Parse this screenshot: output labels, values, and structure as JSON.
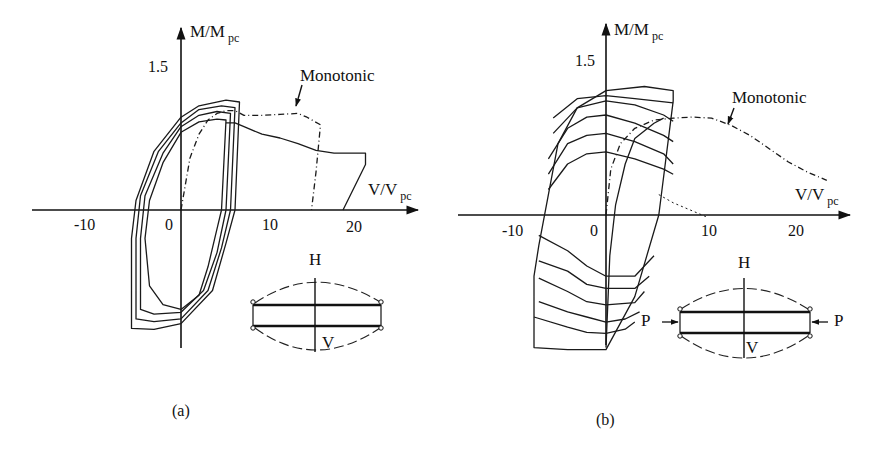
{
  "figure": {
    "captions": [
      "(a)",
      "(b)"
    ]
  },
  "chart_data": [
    {
      "type": "line",
      "panel": "(a)",
      "title": "",
      "xlabel": "V/V",
      "xlabel_sub": "pc",
      "ylabel": "M/M",
      "ylabel_sub": "pc",
      "x_ticks": [
        "-10",
        "0",
        "10",
        "20"
      ],
      "y_ticks": [
        "1.5"
      ],
      "xlim": [
        -16,
        26
      ],
      "ylim": [
        -1.5,
        1.7
      ],
      "grid": false,
      "annotation": "Monotonic",
      "inset": {
        "top_label": "H",
        "bottom_label": "V",
        "axial_load": false
      },
      "series": [
        {
          "name": "Monotonic",
          "style": "dashdot",
          "x": [
            0,
            1,
            2,
            3,
            4,
            5,
            6,
            7,
            9,
            11,
            13,
            14,
            15.5,
            15,
            14.5
          ],
          "y": [
            0,
            0.55,
            0.8,
            0.95,
            1.02,
            1.05,
            1.05,
            1.0,
            1.0,
            1.01,
            1.02,
            0.98,
            0.9,
            0.4,
            0
          ]
        },
        {
          "name": "Cyclic envelope tail",
          "style": "solid",
          "x": [
            5,
            6,
            7,
            9,
            11,
            13,
            15,
            17,
            20.5,
            20.5,
            18
          ],
          "y": [
            0.92,
            0.92,
            0.88,
            0.8,
            0.76,
            0.7,
            0.63,
            0.6,
            0.6,
            0.48,
            0
          ]
        },
        {
          "name": "Cycle 1",
          "style": "solid",
          "x": [
            4.5,
            5,
            4,
            2,
            0,
            -2,
            -3.5,
            -4,
            -3.5,
            -2,
            0,
            2,
            3,
            4,
            4.5
          ],
          "y": [
            0,
            0.95,
            0.96,
            0.93,
            0.82,
            0.5,
            0.1,
            -0.3,
            -0.8,
            -1.0,
            -1.05,
            -0.9,
            -0.6,
            -0.2,
            0
          ]
        },
        {
          "name": "Cycle 2",
          "style": "solid",
          "x": [
            5,
            5.5,
            4,
            2,
            0,
            -2,
            -4,
            -4.5,
            -4.5,
            -3,
            0,
            2.5,
            4,
            5
          ],
          "y": [
            0,
            1.02,
            1.04,
            1.0,
            0.88,
            0.6,
            0.15,
            -0.3,
            -1.05,
            -1.1,
            -1.08,
            -0.85,
            -0.45,
            0
          ]
        },
        {
          "name": "Cycle 3",
          "style": "solid",
          "x": [
            5.5,
            6,
            4.5,
            2,
            0,
            -2.5,
            -4.5,
            -5,
            -5,
            -3,
            0,
            3,
            4.5,
            5.5
          ],
          "y": [
            0,
            1.08,
            1.1,
            1.06,
            0.92,
            0.62,
            0.15,
            -0.3,
            -1.15,
            -1.18,
            -1.15,
            -0.85,
            -0.4,
            0
          ]
        },
        {
          "name": "Cycle 4",
          "style": "solid",
          "x": [
            6,
            6.5,
            5,
            2,
            0,
            -3,
            -5,
            -5.5,
            -5.5,
            -3,
            0,
            3.5,
            5,
            6
          ],
          "y": [
            0,
            1.14,
            1.16,
            1.1,
            0.98,
            0.62,
            0.1,
            -0.3,
            -1.25,
            -1.26,
            -1.2,
            -0.85,
            -0.35,
            0
          ]
        }
      ]
    },
    {
      "type": "line",
      "panel": "(b)",
      "title": "",
      "xlabel": "V/V",
      "xlabel_sub": "pc",
      "ylabel": "M/M",
      "ylabel_sub": "pc",
      "x_ticks": [
        "-10",
        "0",
        "10",
        "20"
      ],
      "y_ticks": [
        "1.5"
      ],
      "xlim": [
        -16,
        25
      ],
      "ylim": [
        -1.5,
        1.6
      ],
      "grid": false,
      "annotation": "Monotonic",
      "inset": {
        "top_label": "H",
        "bottom_label": "V",
        "axial_load": true,
        "load_label": "P"
      },
      "series": [
        {
          "name": "Monotonic",
          "style": "dashdot",
          "x": [
            0,
            0.5,
            1.5,
            3,
            5,
            7,
            9,
            11,
            13,
            15,
            17,
            19,
            21,
            23
          ],
          "y": [
            0,
            0.45,
            0.7,
            0.85,
            0.93,
            0.95,
            0.96,
            0.95,
            0.88,
            0.78,
            0.65,
            0.52,
            0.42,
            0.34
          ]
        },
        {
          "name": "Outer loop",
          "style": "solid",
          "x": [
            5.5,
            7,
            7,
            4,
            0,
            -3,
            -5,
            -6,
            -7,
            -7.5,
            -7.5,
            -4,
            0,
            3,
            5.5
          ],
          "y": [
            0,
            1.12,
            1.22,
            1.26,
            1.22,
            1.05,
            0.7,
            0.2,
            -0.3,
            -0.6,
            -1.3,
            -1.32,
            -1.32,
            -0.8,
            0
          ]
        },
        {
          "name": "Cycle a",
          "style": "solid",
          "x": [
            -6,
            -4,
            -2,
            0,
            3,
            6,
            7
          ],
          "y": [
            0.25,
            0.5,
            0.6,
            0.62,
            0.55,
            0.45,
            0.4
          ]
        },
        {
          "name": "Cycle b",
          "style": "solid",
          "x": [
            -6,
            -4,
            -2,
            0,
            3,
            6,
            7
          ],
          "y": [
            0.4,
            0.7,
            0.78,
            0.8,
            0.72,
            0.6,
            0.5
          ]
        },
        {
          "name": "Cycle c",
          "style": "solid",
          "x": [
            -6,
            -4,
            -2,
            0,
            3,
            6,
            7
          ],
          "y": [
            0.55,
            0.85,
            0.96,
            0.98,
            0.9,
            0.78,
            0.72
          ]
        },
        {
          "name": "Cycle d",
          "style": "solid",
          "x": [
            -5.5,
            -3,
            0,
            3,
            6,
            7
          ],
          "y": [
            0.8,
            1.05,
            1.12,
            1.08,
            0.98,
            0.92
          ]
        },
        {
          "name": "Cycle e",
          "style": "solid",
          "x": [
            -5.5,
            -3,
            0,
            3,
            7
          ],
          "y": [
            0.95,
            1.14,
            1.17,
            1.14,
            1.1
          ]
        },
        {
          "name": "Cycle f",
          "style": "solid",
          "x": [
            -7,
            -4,
            -2,
            0,
            3,
            5
          ],
          "y": [
            -0.2,
            -0.35,
            -0.5,
            -0.6,
            -0.6,
            -0.4
          ]
        },
        {
          "name": "Cycle g",
          "style": "solid",
          "x": [
            -7,
            -4,
            -2,
            0,
            3,
            4.5
          ],
          "y": [
            -0.45,
            -0.55,
            -0.68,
            -0.72,
            -0.72,
            -0.6
          ]
        },
        {
          "name": "Cycle h",
          "style": "solid",
          "x": [
            -7,
            -4,
            -2,
            0,
            3,
            4
          ],
          "y": [
            -0.62,
            -0.75,
            -0.85,
            -0.88,
            -0.86,
            -0.75
          ]
        },
        {
          "name": "Cycle i",
          "style": "solid",
          "x": [
            -7,
            -4,
            -2,
            0,
            2,
            3.5
          ],
          "y": [
            -0.85,
            -0.95,
            -1.0,
            -1.05,
            -1.02,
            -0.95
          ]
        },
        {
          "name": "Cycle j",
          "style": "solid",
          "x": [
            -7.5,
            -4,
            -2,
            0,
            2,
            3
          ],
          "y": [
            -1.0,
            -1.1,
            -1.15,
            -1.16,
            -1.12,
            -1.05
          ]
        },
        {
          "name": "Loading branch",
          "style": "solid",
          "x": [
            0,
            0.4,
            1,
            2,
            3,
            5,
            6
          ],
          "y": [
            -1.3,
            -0.4,
            0.1,
            0.5,
            0.75,
            0.9,
            0.95
          ]
        },
        {
          "name": "Post-peak tail",
          "style": "dashed",
          "x": [
            5.5,
            7,
            9,
            10.5
          ],
          "y": [
            0.2,
            0.12,
            0.04,
            -0.02
          ]
        }
      ]
    }
  ]
}
